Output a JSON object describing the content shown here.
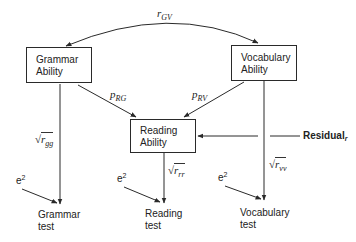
{
  "diagram": {
    "type": "path-diagram",
    "nodes": {
      "grammar_ability": {
        "line1": "Grammar",
        "line2": "Ability"
      },
      "vocabulary_ability": {
        "line1": "Vocabulary",
        "line2": "Ability"
      },
      "reading_ability": {
        "line1": "Reading",
        "line2": "Ability"
      },
      "grammar_test": {
        "line1": "Grammar",
        "line2": "test"
      },
      "reading_test": {
        "line1": "Reading",
        "line2": "test"
      },
      "vocabulary_test": {
        "line1": "Vocabulary",
        "line2": "test"
      }
    },
    "paths": {
      "r_gv": {
        "symbol": "r",
        "subscript": "GV"
      },
      "p_rg": {
        "symbol": "p",
        "subscript": "RG"
      },
      "p_rv": {
        "symbol": "p",
        "subscript": "RV"
      },
      "sqrt_r_gg": {
        "radical": "√",
        "symbol": "r",
        "subscript": "gg"
      },
      "sqrt_r_rr": {
        "radical": "√",
        "symbol": "r",
        "subscript": "rr"
      },
      "sqrt_r_vv": {
        "radical": "√",
        "symbol": "r",
        "subscript": "vv"
      }
    },
    "errors": {
      "grammar": {
        "base": "e",
        "exp": "2"
      },
      "reading": {
        "base": "e",
        "exp": "2"
      },
      "vocabulary": {
        "base": "e",
        "exp": "2"
      }
    },
    "residual": {
      "label": "Residual",
      "subscript": "r"
    },
    "colors": {
      "line": "#2a2a2a",
      "background": "#ffffff"
    }
  }
}
